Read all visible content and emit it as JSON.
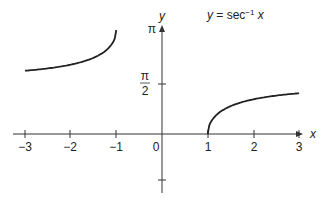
{
  "chart_data": {
    "type": "line",
    "title_parts": {
      "lhs": "y",
      "eq": " = sec",
      "sup": "−1",
      "var": " x"
    },
    "xlabel": "x",
    "ylabel": "y",
    "x_ticks": [
      "−3",
      "−2",
      "−1",
      "0",
      "1",
      "2",
      "3"
    ],
    "y_ticks": [
      "π",
      "π/2"
    ],
    "y_tick_pi": "π",
    "y_tick_half_num": "π",
    "y_tick_half_den": "2",
    "origin_label": "0",
    "xlim": [
      -3,
      3
    ],
    "ylim": [
      -1.2,
      3.14159
    ],
    "series": [
      {
        "name": "left branch",
        "x": [
          -3,
          -2.5,
          -2,
          -1.5,
          -1.2,
          -1.05,
          -1
        ],
        "y": [
          1.9106,
          1.9823,
          2.0944,
          2.3005,
          2.5559,
          2.8307,
          3.1416
        ]
      },
      {
        "name": "right branch",
        "x": [
          1,
          1.05,
          1.2,
          1.5,
          2,
          2.5,
          3
        ],
        "y": [
          0,
          0.3109,
          0.5857,
          0.8411,
          1.0472,
          1.1593,
          1.231
        ]
      }
    ],
    "grid": false,
    "legend": "none"
  }
}
